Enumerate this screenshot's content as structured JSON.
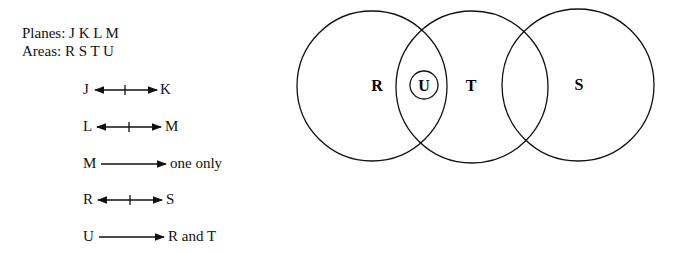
{
  "header": {
    "planes": "Planes: J K L M",
    "areas": "Areas: R S T U"
  },
  "rules": [
    {
      "left": "J",
      "right": "K",
      "type": "not-bidirectional"
    },
    {
      "left": "L",
      "right": "M",
      "type": "not-bidirectional"
    },
    {
      "left": "M",
      "right": "one only",
      "type": "directional"
    },
    {
      "left": "R",
      "right": "S",
      "type": "not-bidirectional"
    },
    {
      "left": "U",
      "right": "R and T",
      "type": "directional"
    }
  ],
  "venn": {
    "labels": {
      "R": "R",
      "U": "U",
      "T": "T",
      "S": "S"
    }
  }
}
